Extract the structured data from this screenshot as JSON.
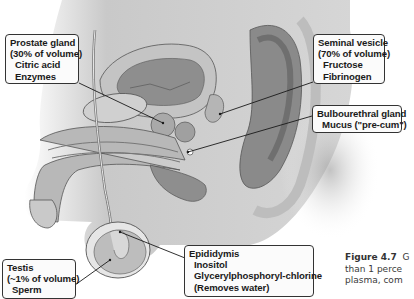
{
  "diagram": {
    "colors": {
      "background": "#ffffff",
      "tissue_light": "#d8d8d8",
      "tissue_mid": "#a8a8a8",
      "tissue_dark": "#6a6a6a",
      "callout_border": "#333333",
      "callout_fill": "#fbfbfb",
      "leader_line": "#1a1a1a"
    }
  },
  "callouts": {
    "prostate": {
      "lines": [
        "Prostate gland",
        "(30% of volume)",
        "Citric acid",
        "Enzymes"
      ]
    },
    "seminal_vesicle": {
      "lines": [
        "Seminal vesicle",
        "(70% of volume)",
        "Fructose",
        "Fibrinogen"
      ]
    },
    "bulbourethral": {
      "lines": [
        "Bulbourethral gland",
        "Mucus (\"pre-cum\")"
      ]
    },
    "testis": {
      "lines": [
        "Testis",
        "(~1% of volume)",
        "Sperm"
      ]
    },
    "epididymis": {
      "lines": [
        "Epididymis",
        "Inositol",
        "Glycerylphosphoryl-chlorine",
        "(Removes water)"
      ]
    }
  },
  "caption": {
    "figure_label": "Figure 4.7",
    "lines": [
      "G",
      "than 1 perce",
      "plasma, com"
    ]
  }
}
